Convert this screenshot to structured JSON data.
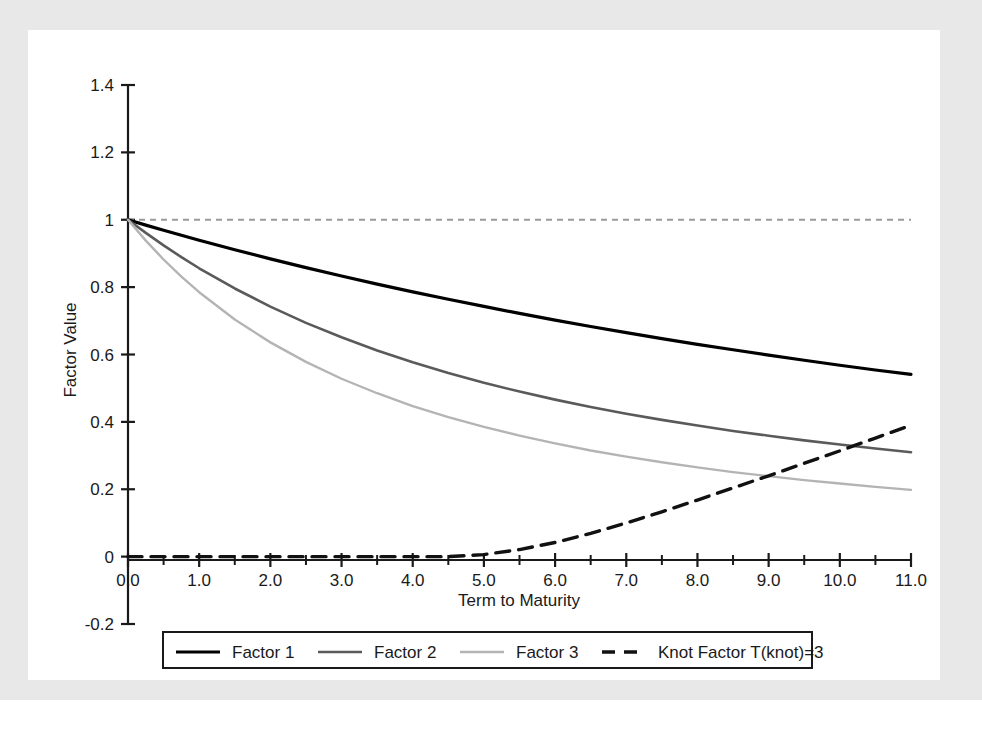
{
  "figure": {
    "caption": "",
    "background_color": "#e8e8e8",
    "panel_color": "#ffffff"
  },
  "axes": {
    "x_title": "Term to Maturity",
    "y_title": "Factor Value",
    "x_ticks": [
      "0.0",
      "1.0",
      "2.0",
      "3.0",
      "4.0",
      "5.0",
      "6.0",
      "7.0",
      "8.0",
      "9.0",
      "10.0",
      "11.0"
    ],
    "y_ticks": [
      "1.4",
      "1.2",
      "1",
      "0.8",
      "0.6",
      "0.4",
      "0.2",
      "0",
      "-0.2"
    ]
  },
  "legend": {
    "items": [
      {
        "label": "Factor 1",
        "color": "#000000",
        "dash": "none",
        "width": 3.2
      },
      {
        "label": "Factor 2",
        "color": "#5a5a5a",
        "dash": "none",
        "width": 2.6
      },
      {
        "label": "Factor 3",
        "color": "#b4b4b4",
        "dash": "none",
        "width": 2.4
      },
      {
        "label": "Knot Factor T(knot)=3",
        "color": "#111111",
        "dash": "14,9",
        "width": 3.4
      }
    ]
  },
  "chart_data": {
    "type": "line",
    "title": "",
    "xlabel": "Term to Maturity",
    "ylabel": "Factor Value",
    "xlim": [
      0,
      11
    ],
    "ylim": [
      -0.2,
      1.4
    ],
    "grid": false,
    "legend_position": "bottom",
    "x": [
      0,
      0.25,
      0.5,
      0.75,
      1,
      1.5,
      2,
      2.5,
      3,
      3.5,
      4,
      4.5,
      5,
      5.5,
      6,
      6.5,
      7,
      7.5,
      8,
      8.5,
      9,
      9.5,
      10,
      10.5,
      11
    ],
    "series": [
      {
        "name": "Factor 1",
        "color": "#000000",
        "dash": "none",
        "values": [
          1.0,
          0.984,
          0.969,
          0.954,
          0.939,
          0.911,
          0.884,
          0.858,
          0.833,
          0.809,
          0.786,
          0.764,
          0.743,
          0.722,
          0.702,
          0.683,
          0.665,
          0.647,
          0.63,
          0.614,
          0.598,
          0.583,
          0.568,
          0.554,
          0.541
        ]
      },
      {
        "name": "Factor 2",
        "color": "#5a5a5a",
        "dash": "none",
        "values": [
          1.0,
          0.961,
          0.924,
          0.889,
          0.856,
          0.796,
          0.742,
          0.694,
          0.651,
          0.612,
          0.577,
          0.545,
          0.516,
          0.49,
          0.466,
          0.444,
          0.424,
          0.406,
          0.389,
          0.373,
          0.359,
          0.345,
          0.333,
          0.321,
          0.31
        ]
      },
      {
        "name": "Factor 3",
        "color": "#b4b4b4",
        "dash": "none",
        "values": [
          1.0,
          0.938,
          0.882,
          0.831,
          0.785,
          0.704,
          0.636,
          0.578,
          0.528,
          0.485,
          0.447,
          0.414,
          0.385,
          0.359,
          0.336,
          0.315,
          0.297,
          0.28,
          0.265,
          0.251,
          0.239,
          0.227,
          0.217,
          0.207,
          0.198
        ]
      },
      {
        "name": "Knot Factor T(knot)=3",
        "color": "#111111",
        "dash": "14,9",
        "values": [
          0,
          0,
          0,
          0,
          0,
          0,
          0,
          0,
          0,
          0,
          0.0,
          0.0,
          0.006,
          0.021,
          0.042,
          0.069,
          0.1,
          0.133,
          0.168,
          0.204,
          0.24,
          0.277,
          0.314,
          0.352,
          0.39
        ]
      }
    ],
    "reference_line": {
      "name": "unit-reference",
      "y": 1.0,
      "color": "#9a9a9a",
      "dash": "6,5"
    },
    "annotations": [
      "Knot factor crosses Factor 3 near term 8.8 at value 0.20",
      "Knot factor crosses Factor 2 near term 9.9 at value 0.29"
    ]
  }
}
